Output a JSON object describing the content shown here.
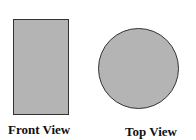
{
  "views": [
    {
      "label": "Front View",
      "shape": "rectangle",
      "fill": "#b4b4b4",
      "stroke": "#333333"
    },
    {
      "label": "Top View",
      "shape": "circle",
      "fill": "#b4b4b4",
      "stroke": "#333333"
    }
  ]
}
